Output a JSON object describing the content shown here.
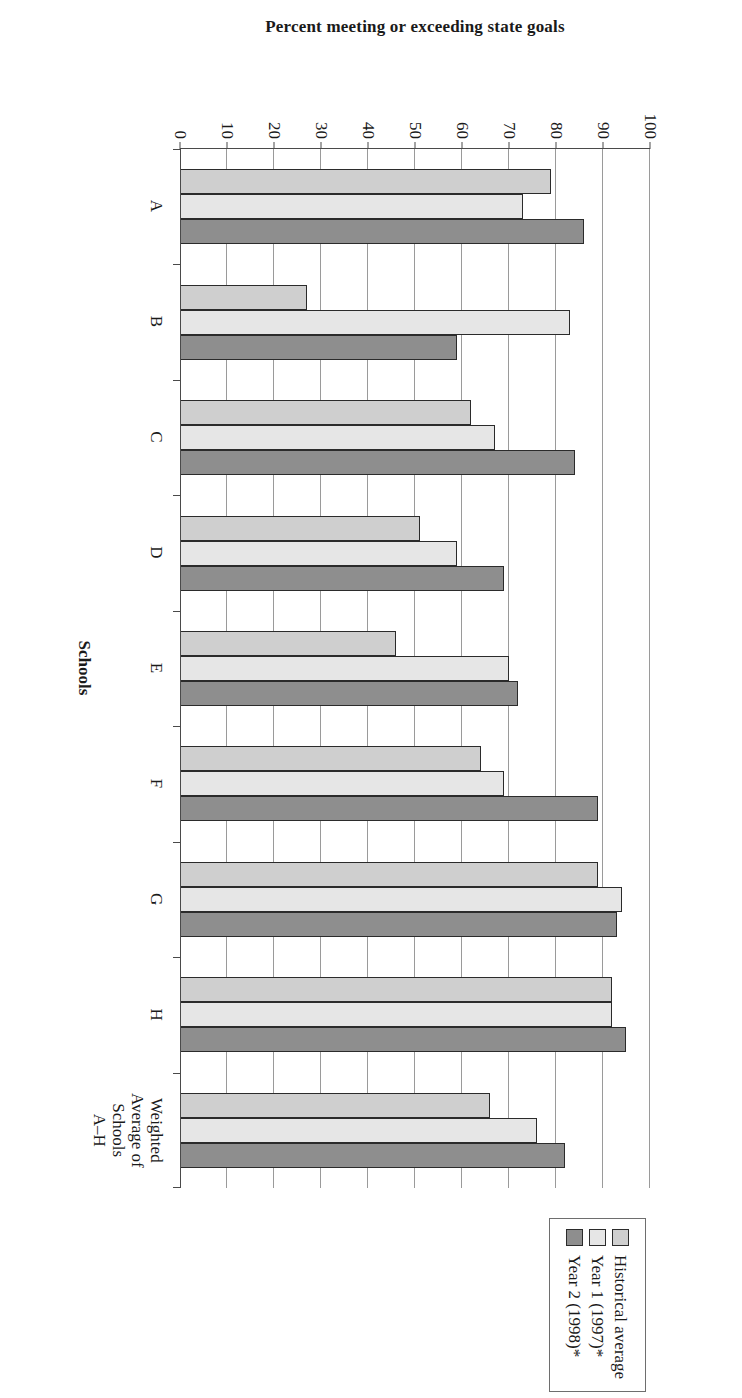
{
  "chart_data": {
    "type": "bar",
    "title": "",
    "subtitle": "",
    "orientation": "vertical-grouped",
    "xlabel": "Schools",
    "ylabel": "Percent meeting or exceeding state goals",
    "ylim": [
      0,
      100
    ],
    "ytick_labels": [
      "0",
      "10",
      "20",
      "30",
      "40",
      "50",
      "60",
      "70",
      "80",
      "90",
      "100"
    ],
    "ytick_values": [
      0,
      10,
      20,
      30,
      40,
      50,
      60,
      70,
      80,
      90,
      100
    ],
    "grid": "horizontal",
    "legend_position": "right",
    "categories": [
      "A",
      "B",
      "C",
      "D",
      "E",
      "F",
      "G",
      "H",
      "Weighted\nAverage of\nSchools\nA–H"
    ],
    "category_labels": [
      {
        "lines": [
          "A"
        ]
      },
      {
        "lines": [
          "B"
        ]
      },
      {
        "lines": [
          "C"
        ]
      },
      {
        "lines": [
          "D"
        ]
      },
      {
        "lines": [
          "E"
        ]
      },
      {
        "lines": [
          "F"
        ]
      },
      {
        "lines": [
          "G"
        ]
      },
      {
        "lines": [
          "H"
        ]
      },
      {
        "lines": [
          "Weighted",
          "Average of",
          "Schools",
          "A–H"
        ]
      }
    ],
    "series": [
      {
        "name": "Historical average",
        "color": "#cfcfcf",
        "values": [
          79,
          27,
          62,
          51,
          46,
          64,
          89,
          92,
          66
        ]
      },
      {
        "name": "Year 1 (1997)*",
        "color": "#e6e6e6",
        "values": [
          73,
          83,
          67,
          59,
          70,
          69,
          94,
          92,
          76
        ]
      },
      {
        "name": "Year 2 (1998)*",
        "color": "#8e8e8e",
        "values": [
          86,
          59,
          84,
          69,
          72,
          89,
          93,
          95,
          82
        ]
      }
    ]
  },
  "legend": {
    "entries": [
      {
        "label": "Historical average",
        "swatch": "legend-swatch-historical"
      },
      {
        "label": "Year 1 (1997)*",
        "swatch": "legend-swatch-year1"
      },
      {
        "label": "Year 2 (1998)*",
        "swatch": "legend-swatch-year2"
      }
    ]
  },
  "axes": {
    "y_title": "Percent meeting or exceeding state goals",
    "x_title": "Schools"
  },
  "colors": {
    "series_historical": "#cfcfcf",
    "series_year1": "#e6e6e6",
    "series_year2": "#8e8e8e",
    "axis": "#4a4a4a",
    "grid": "#9a9a9a",
    "bar_outline": "#2b2b2b",
    "background": "#ffffff"
  }
}
